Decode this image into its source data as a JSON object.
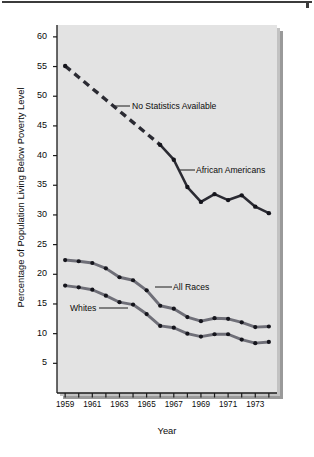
{
  "figure": {
    "background": "#ffffff",
    "panel_background": "#e3e3e3",
    "line_color": "#2b2b33",
    "marker_color": "#15151c"
  },
  "axes": {
    "ylabel": "Percentage of Population Living Below Poverty Level",
    "xlabel": "Year",
    "y_ticks": [
      5,
      10,
      15,
      20,
      25,
      30,
      35,
      40,
      45,
      50,
      55,
      60
    ],
    "y_tick_labels": [
      "5",
      "10",
      "15",
      "20",
      "25",
      "30",
      "35",
      "40",
      "45",
      "50",
      "55",
      "60"
    ],
    "x_tick_labels": [
      "1959",
      "1961",
      "1963",
      "1965",
      "1967",
      "1969",
      "1971",
      "1973"
    ]
  },
  "annotations": {
    "no_statistics": "No Statistics Available",
    "african_americans": "African Americans",
    "all_races": "All Races",
    "whites": "Whites"
  },
  "chart_data": {
    "type": "line",
    "title": "",
    "xlabel": "Year",
    "ylabel": "Percentage of Population Living Below Poverty Level",
    "xlim": [
      1958.4,
      1974.6
    ],
    "ylim": [
      0,
      62
    ],
    "grid": false,
    "legend": "annotated-inline",
    "x": [
      1959,
      1960,
      1961,
      1962,
      1963,
      1964,
      1965,
      1966,
      1967,
      1968,
      1969,
      1970,
      1971,
      1972,
      1973,
      1974
    ],
    "series": [
      {
        "name": "African Americans",
        "values": [
          55.1,
          53.2,
          51.3,
          49.4,
          47.5,
          45.6,
          43.7,
          41.8,
          39.3,
          34.7,
          32.2,
          33.5,
          32.5,
          33.3,
          31.4,
          30.3
        ],
        "style": "dashed-then-solid",
        "dashed_through_index": 7,
        "note": "No Statistics Available for 1960-1965; dashed interpolation 1959-1966"
      },
      {
        "name": "All Races",
        "values": [
          22.4,
          22.2,
          21.9,
          21.0,
          19.5,
          19.0,
          17.3,
          14.7,
          14.2,
          12.8,
          12.1,
          12.6,
          12.5,
          11.9,
          11.1,
          11.2
        ]
      },
      {
        "name": "Whites",
        "values": [
          18.1,
          17.8,
          17.4,
          16.4,
          15.3,
          14.9,
          13.3,
          11.3,
          11.0,
          10.0,
          9.5,
          9.9,
          9.9,
          9.0,
          8.4,
          8.6
        ]
      }
    ]
  }
}
